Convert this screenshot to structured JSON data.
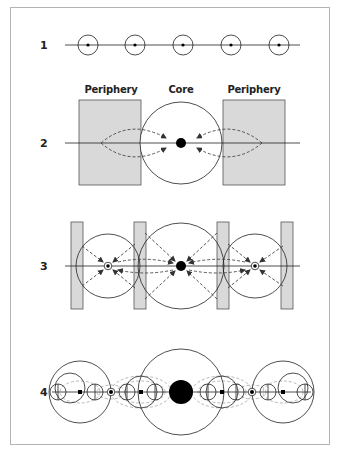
{
  "figure": {
    "rows": [
      {
        "id": 1,
        "label": "1"
      },
      {
        "id": 2,
        "label": "2"
      },
      {
        "id": 3,
        "label": "3"
      },
      {
        "id": 4,
        "label": "4"
      }
    ],
    "zone_labels": {
      "left_periphery": "Periphery",
      "core": "Core",
      "right_periphery": "Periphery"
    },
    "colors": {
      "line": "#222222",
      "fill_periphery": "#d9d9d9",
      "frame": "#b3b3b3",
      "dashed": "#444444",
      "dashed_light": "#9a9a9a",
      "node": "#000000"
    }
  }
}
